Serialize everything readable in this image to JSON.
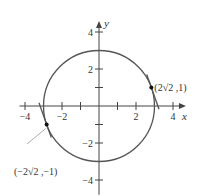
{
  "figure": {
    "title": "",
    "x_axis_label": "x",
    "y_axis_label": "y",
    "x_range": [
      -4.3,
      4.7
    ],
    "y_range": [
      -4.8,
      4.6
    ],
    "x_ticks": [
      -4,
      -3,
      -2,
      -1,
      1,
      2,
      3,
      4
    ],
    "x_tick_labels": [
      {
        "value": -4,
        "label": "−4"
      },
      {
        "value": -2,
        "label": "−2"
      },
      {
        "value": 2,
        "label": "2"
      },
      {
        "value": 4,
        "label": "4"
      }
    ],
    "y_ticks": [
      -4,
      -3,
      -2,
      -1,
      1,
      2,
      3,
      4
    ],
    "y_tick_labels": [
      {
        "value": 4,
        "label": "4"
      },
      {
        "value": 2,
        "label": "2"
      },
      {
        "value": -2,
        "label": "−2"
      },
      {
        "value": -4,
        "label": "−4"
      }
    ],
    "circle": {
      "equation": "x^2 + y^2 = 9",
      "center": [
        0,
        0
      ],
      "radius": 3
    },
    "points": [
      {
        "x": 2.8284,
        "y": 1,
        "label": "(2√2 ,1)"
      },
      {
        "x": -2.8284,
        "y": -1,
        "label": "(−2√2 ,−1)"
      }
    ],
    "tangent_lines": [
      {
        "through": [
          2.8284,
          1
        ],
        "slope": -2.8284,
        "t_range": [
          -0.75,
          1.25
        ]
      },
      {
        "through": [
          -2.8284,
          -1
        ],
        "slope": -2.8284,
        "t_range": [
          -1.25,
          0.75
        ]
      }
    ]
  },
  "colors": {
    "curve": "#555555",
    "axis": "#444444",
    "text": "#333333"
  }
}
